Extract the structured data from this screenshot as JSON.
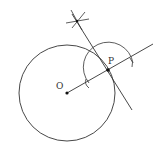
{
  "diagram": {
    "type": "geometry-construction",
    "points": {
      "O": {
        "label": "O",
        "x": 67,
        "y": 93
      },
      "P": {
        "label": "P",
        "x": 108,
        "y": 70
      }
    },
    "circle": {
      "center": "O",
      "radius": 48
    },
    "colors": {
      "stroke": "#333333",
      "background": "#ffffff"
    }
  }
}
